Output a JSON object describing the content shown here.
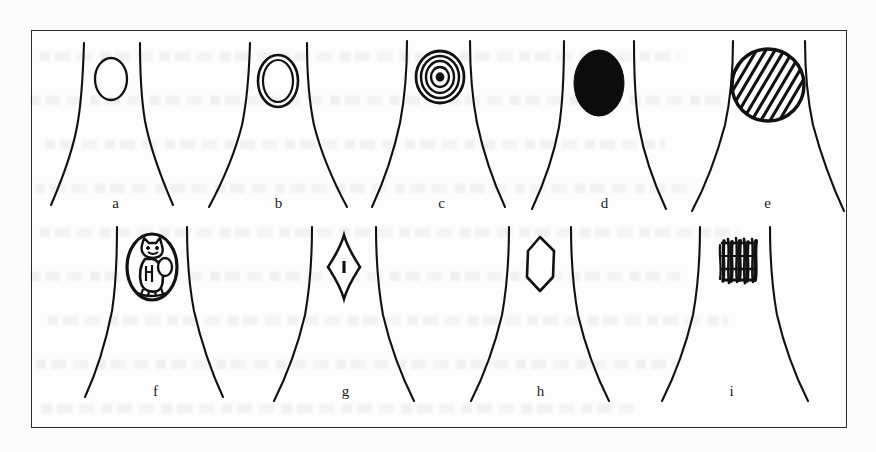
{
  "figure": {
    "kind": "scanned-line-drawing-figure",
    "frame": {
      "border_color": "#2a2a2a",
      "background": "#fcfcfc"
    },
    "ink_color": "#111111",
    "rows": 2,
    "columns": 5,
    "panels": [
      {
        "id": "a",
        "label": "a",
        "inclusion": "small-empty-oval",
        "inclusion_desc": "small empty oval outline between the two curves"
      },
      {
        "id": "b",
        "label": "b",
        "inclusion": "double-ring-oval",
        "inclusion_desc": "oval with a second concentric outline inside"
      },
      {
        "id": "c",
        "label": "c",
        "inclusion": "concentric-rings",
        "inclusion_desc": "target of four to five concentric rings with a dark centre"
      },
      {
        "id": "d",
        "label": "d",
        "inclusion": "solid-black-ellipse",
        "inclusion_desc": "completely filled black ellipse"
      },
      {
        "id": "e",
        "label": "e",
        "inclusion": "hatched-circle",
        "inclusion_desc": "large circle filled with diagonal hatching, touching both curves"
      },
      {
        "id": "f",
        "label": "f",
        "inclusion": "oval-with-figure",
        "inclusion_desc": "oval containing a small scribbled animal-like figure"
      },
      {
        "id": "g",
        "label": "g",
        "inclusion": "diamond-with-bar",
        "inclusion_desc": "tall narrow diamond with a short vertical bar at its centre"
      },
      {
        "id": "h",
        "label": "h",
        "inclusion": "empty-hexagon",
        "inclusion_desc": "empty elongated hexagon outline"
      },
      {
        "id": "i",
        "label": "i",
        "inclusion": "dense-vertical-scribble",
        "inclusion_desc": "dense block of vertical scribbled strokes, no outline"
      }
    ]
  }
}
